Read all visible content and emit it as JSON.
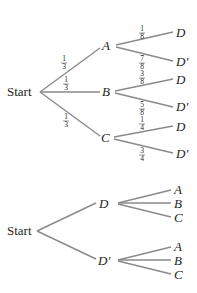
{
  "tree1": {
    "root": "Start",
    "level1": [
      {
        "label": "A",
        "prob": {
          "num": "1",
          "den": "3"
        }
      },
      {
        "label": "B",
        "prob": {
          "num": "1",
          "den": "3"
        }
      },
      {
        "label": "C",
        "prob": {
          "num": "1",
          "den": "3"
        }
      }
    ],
    "level2": [
      {
        "parent": "A",
        "label": "D",
        "prob": {
          "num": "1",
          "den": "8"
        }
      },
      {
        "parent": "A",
        "label": "D′",
        "prob": {
          "num": "7",
          "den": "8"
        }
      },
      {
        "parent": "B",
        "label": "D",
        "prob": {
          "num": "3",
          "den": "8"
        }
      },
      {
        "parent": "B",
        "label": "D′",
        "prob": {
          "num": "5",
          "den": "8"
        }
      },
      {
        "parent": "C",
        "label": "D",
        "prob": {
          "num": "1",
          "den": "4"
        }
      },
      {
        "parent": "C",
        "label": "D′",
        "prob": {
          "num": "3",
          "den": "4"
        }
      }
    ]
  },
  "tree2": {
    "root": "Start",
    "level1": [
      {
        "label": "D"
      },
      {
        "label": "D′"
      }
    ],
    "level2": [
      {
        "parent": "D",
        "label": "A"
      },
      {
        "parent": "D",
        "label": "B"
      },
      {
        "parent": "D",
        "label": "C"
      },
      {
        "parent": "D′",
        "label": "A"
      },
      {
        "parent": "D′",
        "label": "B"
      },
      {
        "parent": "D′",
        "label": "C"
      }
    ]
  }
}
